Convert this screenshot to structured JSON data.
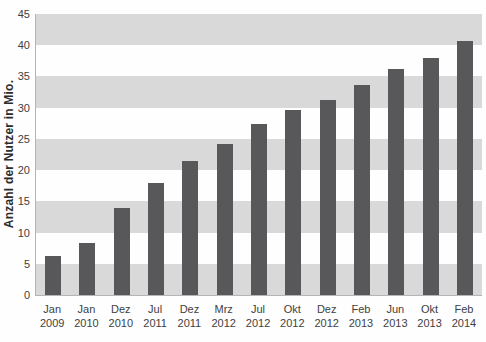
{
  "colors": {
    "bar": "#58585b",
    "band": "#d9d9d9",
    "plot_background": "#fefefe",
    "axis_line": "#b5b5b5",
    "tick_text": "#3f3f3f",
    "axis_title_text": "#2b2b2b"
  },
  "chart_data": {
    "type": "bar",
    "title": "",
    "xlabel": "",
    "ylabel": "Anzahl der Nutzer in Mio.",
    "ylim": [
      0,
      45
    ],
    "ytick_step": 5,
    "ytick_labels": [
      "0",
      "5",
      "10",
      "15",
      "20",
      "25",
      "30",
      "35",
      "40",
      "45"
    ],
    "categories": [
      "Jan 2009",
      "Jan 2010",
      "Dez 2010",
      "Jul 2011",
      "Dez 2011",
      "Mrz 2012",
      "Jul 2012",
      "Okt 2012",
      "Dez 2012",
      "Feb 2013",
      "Jun 2013",
      "Okt 2013",
      "Feb 2014"
    ],
    "values": [
      6.3,
      8.4,
      14.0,
      17.9,
      21.4,
      24.2,
      27.4,
      29.6,
      31.3,
      33.7,
      36.2,
      37.9,
      40.6
    ],
    "legend": "none",
    "grid": "alternating horizontal bands of 5 units, gray at top band (40-45) and bottom band (0-5)"
  }
}
